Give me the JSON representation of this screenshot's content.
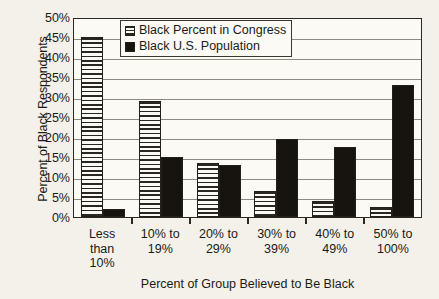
{
  "chart_data": {
    "type": "bar",
    "title": "",
    "xlabel": "Percent of Group Believed to Be Black",
    "ylabel": "Percent of Black Respondents",
    "categories": [
      "Less than 10%",
      "10% to 19%",
      "20% to 29%",
      "30% to 39%",
      "40% to 49%",
      "50% to 100%"
    ],
    "category_lines": [
      [
        "Less",
        "than",
        "10%"
      ],
      [
        "10% to",
        "19%"
      ],
      [
        "20% to",
        "29%"
      ],
      [
        "30% to",
        "39%"
      ],
      [
        "40% to",
        "49%"
      ],
      [
        "50% to",
        "100%"
      ]
    ],
    "series": [
      {
        "name": "Black Percent in Congress",
        "pattern": "horizontal-hatch",
        "values": [
          45,
          29,
          13.5,
          6.5,
          4,
          2.5
        ]
      },
      {
        "name": "Black U.S. Population",
        "pattern": "solid",
        "color": "#17140f",
        "values": [
          2,
          15,
          13,
          19.5,
          17.5,
          33
        ]
      }
    ],
    "ylim": [
      0,
      50
    ],
    "ytick_values": [
      0,
      5,
      10,
      15,
      20,
      25,
      30,
      35,
      40,
      45,
      50
    ],
    "ytick_labels": [
      "0%",
      "5%",
      "10%",
      "15%",
      "20%",
      "25%",
      "30%",
      "35%",
      "40%",
      "45%",
      "50%"
    ],
    "grid": true,
    "grid_axis": "y",
    "legend_position": "top-center"
  },
  "legend": {
    "entries": [
      {
        "label": "Black Percent in Congress",
        "swatch": "hatch-swatch"
      },
      {
        "label": "Black U.S. Population",
        "swatch": "solid-swatch"
      }
    ]
  },
  "colors": {
    "background": "#f3f1ea",
    "plot_background": "#fbfaf4",
    "axis": "#2b2823",
    "gridline": "#8d8a80",
    "bar_solid": "#17140f",
    "bar_hatch_line": "#2a2621"
  }
}
